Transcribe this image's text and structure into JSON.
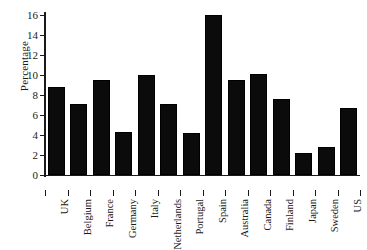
{
  "chart_data": {
    "type": "bar",
    "title": "",
    "xlabel": "",
    "ylabel": "Percentage",
    "ylim": [
      0,
      16
    ],
    "yticks": [
      0,
      2,
      4,
      6,
      8,
      10,
      12,
      14,
      16
    ],
    "ytick_labels": [
      "0",
      "2",
      "4",
      "6",
      "8",
      "10",
      "12",
      "14",
      "16"
    ],
    "grid": false,
    "legend": null,
    "bar_color": "#0b0b0b",
    "axis_color": "#1a1a1a",
    "categories": [
      "UK",
      "Belgium",
      "France",
      "Germany",
      "Italy",
      "Netherlands",
      "Portugal",
      "Spain",
      "Australia",
      "Canada",
      "Finland",
      "Japan",
      "Sweden",
      "US"
    ],
    "values": [
      8.8,
      7.1,
      9.5,
      4.3,
      10.0,
      7.1,
      4.2,
      16.0,
      9.5,
      10.1,
      7.6,
      2.2,
      2.8,
      6.7
    ]
  }
}
